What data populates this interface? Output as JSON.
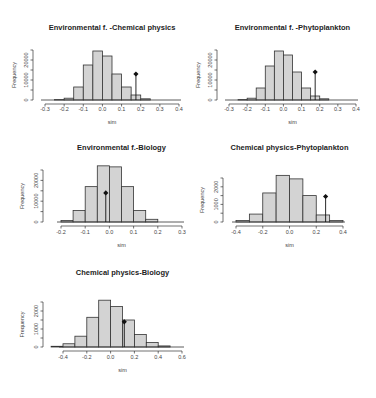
{
  "figure_label": "",
  "chart_data": [
    {
      "type": "bar",
      "title": "Environmental f. -Chemical physics",
      "xlabel": "sim",
      "ylabel": "Frequency",
      "xlim": [
        -0.3,
        0.4
      ],
      "ylim": [
        0,
        25000
      ],
      "xticks": [
        "-0.3",
        "-0.2",
        "-0.1",
        "0.0",
        "0.1",
        "0.2",
        "0.3",
        "0.4"
      ],
      "yticks": [
        "0",
        "10000",
        "20000"
      ],
      "bin_edges": [
        -0.25,
        -0.2,
        -0.15,
        -0.1,
        -0.05,
        0.0,
        0.05,
        0.1,
        0.15,
        0.2,
        0.25
      ],
      "values": [
        200,
        900,
        6500,
        17500,
        24500,
        22000,
        13000,
        6500,
        2500,
        600,
        100
      ],
      "observed": {
        "x": 0.175,
        "y": 13000
      },
      "grid": false
    },
    {
      "type": "bar",
      "title": "Environmental f. -Phytoplankton",
      "xlabel": "sim",
      "ylabel": "Frequency",
      "xlim": [
        -0.3,
        0.4
      ],
      "ylim": [
        0,
        25000
      ],
      "xticks": [
        "-0.3",
        "-0.2",
        "-0.1",
        "0.0",
        "0.1",
        "0.2",
        "0.3",
        "0.4"
      ],
      "yticks": [
        "0",
        "10000",
        "20000"
      ],
      "bin_edges": [
        -0.25,
        -0.2,
        -0.15,
        -0.1,
        -0.05,
        0.0,
        0.05,
        0.1,
        0.15,
        0.2,
        0.25
      ],
      "values": [
        200,
        900,
        6000,
        17000,
        24500,
        22500,
        14000,
        6000,
        2000,
        600,
        100
      ],
      "observed": {
        "x": 0.175,
        "y": 14000
      },
      "grid": false
    },
    {
      "type": "bar",
      "title": "Environmental f.-Biology",
      "xlabel": "sim",
      "ylabel": "Frequency",
      "xlim": [
        -0.2,
        0.3
      ],
      "ylim": [
        0,
        25000
      ],
      "xticks": [
        "-0.2",
        "-0.1",
        "0.0",
        "0.1",
        "0.2",
        "0.3"
      ],
      "yticks": [
        "0",
        "10000",
        "20000"
      ],
      "bin_edges": [
        -0.2,
        -0.15,
        -0.1,
        -0.05,
        0.0,
        0.05,
        0.1,
        0.15,
        0.2
      ],
      "values": [
        700,
        5500,
        17000,
        27000,
        26500,
        17000,
        5500,
        1300
      ],
      "observed": {
        "x": -0.015,
        "y": 14000
      },
      "grid": false
    },
    {
      "type": "bar",
      "title": "Chemical physics-Phytoplankton",
      "xlabel": "sim",
      "ylabel": "Frequency",
      "xlim": [
        -0.4,
        0.4
      ],
      "ylim": [
        0,
        2500
      ],
      "xticks": [
        "-0.4",
        "-0.2",
        "0.0",
        "0.2",
        "0.4"
      ],
      "yticks": [
        "0",
        "1000",
        "2000"
      ],
      "bin_edges": [
        -0.4,
        -0.3,
        -0.2,
        -0.1,
        0.0,
        0.1,
        0.2,
        0.3,
        0.4
      ],
      "values": [
        80,
        450,
        1650,
        2650,
        2450,
        1500,
        400,
        80
      ],
      "observed": {
        "x": 0.27,
        "y": 1450
      },
      "grid": false
    },
    {
      "type": "bar",
      "title": "Chemical physics-Biology",
      "xlabel": "sim",
      "ylabel": "Frequency",
      "xlim": [
        -0.4,
        0.6
      ],
      "ylim": [
        0,
        2500
      ],
      "xticks": [
        "-0.4",
        "-0.2",
        "0.0",
        "0.2",
        "0.4",
        "0.6"
      ],
      "yticks": [
        "0",
        "1000",
        "2000"
      ],
      "bin_edges": [
        -0.5,
        -0.4,
        -0.3,
        -0.2,
        -0.1,
        0.0,
        0.1,
        0.2,
        0.3,
        0.4,
        0.5
      ],
      "values": [
        40,
        180,
        600,
        1650,
        2600,
        2250,
        1500,
        700,
        250,
        60
      ],
      "observed": {
        "x": 0.115,
        "y": 1400
      },
      "grid": false
    }
  ]
}
